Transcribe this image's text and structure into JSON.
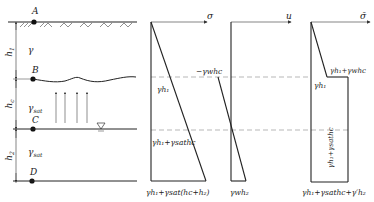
{
  "points": {
    "A": "A",
    "B": "B",
    "C": "C",
    "D": "D"
  },
  "layers": {
    "h1": "h",
    "h1_sub": "1",
    "hc": "h",
    "hc_sub": "c",
    "h2": "h",
    "h2_sub": "2",
    "gamma_upper": "γ",
    "gamma_sat_mid": "γ",
    "gamma_sat_mid_sub": "sat",
    "gamma_sat_low": "γ",
    "gamma_sat_low_sub": "sat"
  },
  "axes": {
    "total_stress": "σ",
    "pore_pressure": "u",
    "effective_stress": "σ̄"
  },
  "total_stress_panel": {
    "at_B": "γh₁",
    "at_C": "γh₁+γsathc",
    "at_D": "γh₁+γsat(hc+h₂)"
  },
  "pore_pressure_panel": {
    "at_B": "−γwhc",
    "at_D": "γwh₂"
  },
  "effective_stress_panel": {
    "at_B_top": "γh₁+γwhc",
    "at_B_left": "γh₁",
    "side": "γh₁+γsathc",
    "at_D": "γh₁+γsathc+γ′h₂"
  },
  "colors": {
    "line": "#222222",
    "dashed": "#888888",
    "thin": "#555555"
  }
}
